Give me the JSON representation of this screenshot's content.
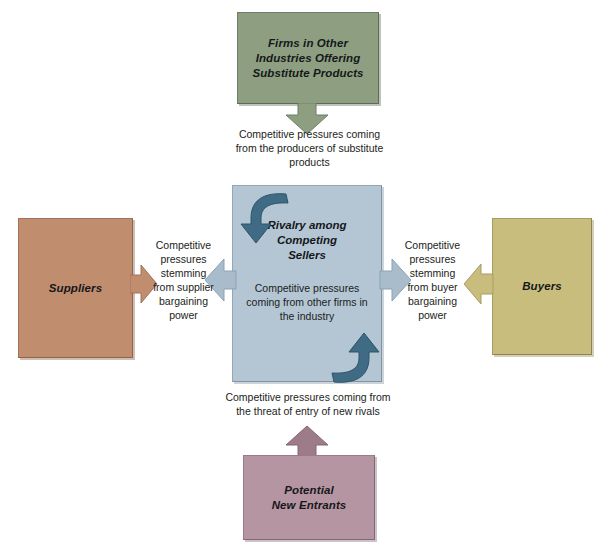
{
  "diagram": {
    "boxes": {
      "substitutes": {
        "label": "Firms in Other Industries Offering Substitute Products",
        "line1": "Firms in Other",
        "line2": "Industries Offering",
        "line3": "Substitute Products",
        "color": "#8d9f80"
      },
      "rivalry": {
        "title_line1": "Rivalry among",
        "title_line2": "Competing",
        "title_line3": "Sellers",
        "body_line1": "Competitive pressures",
        "body_line2": "coming from other firms in",
        "body_line3": "the industry",
        "color": "#b4c6d4"
      },
      "suppliers": {
        "label": "Suppliers",
        "color": "#c08d6e"
      },
      "buyers": {
        "label": "Buyers",
        "color": "#c8bd7d"
      },
      "entrants": {
        "line1": "Potential",
        "line2": "New Entrants",
        "color": "#b595a1"
      }
    },
    "captions": {
      "substitutes": {
        "line1": "Competitive pressures coming",
        "line2": "from the producers of substitute",
        "line3": "products"
      },
      "entrants": {
        "line1": "Competitive pressures coming from",
        "line2": "the threat of entry of new rivals"
      },
      "suppliers": {
        "line1": "Competitive",
        "line2": "pressures",
        "line3": "stemming",
        "line4": "from supplier",
        "line5": "bargaining",
        "line6": "power"
      },
      "buyers": {
        "line1": "Competitive",
        "line2": "pressures",
        "line3": "stemming",
        "line4": "from buyer",
        "line5": "bargaining",
        "line6": "power"
      }
    },
    "arrows": {
      "substitutes_down": "arrow-down-icon",
      "entrants_up": "arrow-up-icon",
      "suppliers_right": "arrow-right-icon",
      "buyers_left": "arrow-left-icon",
      "rivalry_left": "arrow-left-icon",
      "rivalry_right": "arrow-right-icon",
      "rivalry_curve_top": "curved-arrow-down-icon",
      "rivalry_curve_bottom": "curved-arrow-up-icon"
    }
  }
}
